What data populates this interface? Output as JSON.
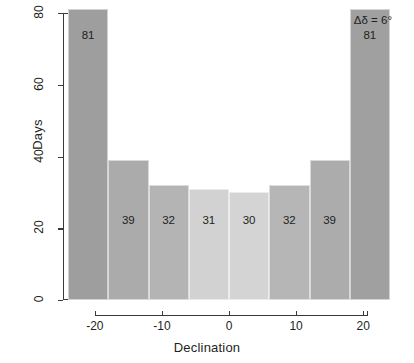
{
  "chart_data": {
    "type": "bar",
    "title": "",
    "subtitle": "",
    "xlabel": "Declination",
    "ylabel": "Days",
    "categories": [
      "-24",
      "-18",
      "-12",
      "-6",
      "0",
      "6",
      "12",
      "18"
    ],
    "bin_edges": [
      -24,
      -18,
      -12,
      -6,
      0,
      6,
      12,
      18,
      24
    ],
    "bin_centers": [
      -21,
      -15,
      -9,
      -3,
      3,
      9,
      15,
      21
    ],
    "values": [
      81,
      39,
      32,
      31,
      30,
      32,
      39,
      81
    ],
    "bar_labels": [
      "81",
      "39",
      "32",
      "31",
      "30",
      "32",
      "39",
      "81"
    ],
    "bar_colors": [
      "#9e9e9e",
      "#ababab",
      "#b4b4b4",
      "#d2d2d2",
      "#d4d4d4",
      "#b6b6b6",
      "#acacac",
      "#a0a0a0"
    ],
    "xlim": [
      -24,
      24
    ],
    "ylim": [
      0,
      80
    ],
    "xticks": [
      -20,
      -10,
      0,
      10,
      20
    ],
    "xtick_labels": [
      "-20",
      "-10",
      "0",
      "10",
      "20"
    ],
    "yticks": [
      0,
      20,
      40,
      60,
      80
    ],
    "ytick_labels": [
      "0",
      "20",
      "40",
      "60",
      "80"
    ],
    "grid": false,
    "legend": false,
    "annotations": [
      {
        "text": "Δδ = 6°",
        "position": "top-right"
      }
    ]
  },
  "annotation": {
    "text": "Δδ = 6°"
  },
  "axes": {
    "x_title": "Declination",
    "y_title": "Days"
  }
}
